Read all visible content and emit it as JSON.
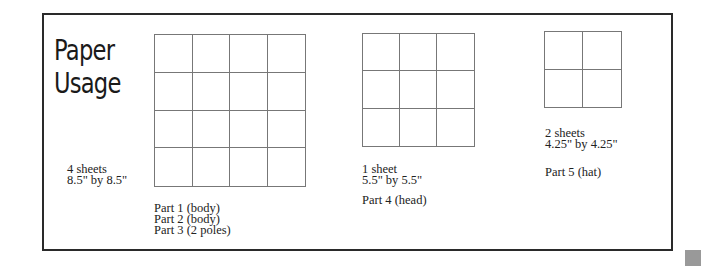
{
  "title": {
    "line1": "Paper",
    "line2": "Usage"
  },
  "sheets": [
    {
      "count": "4 sheets",
      "size": "8.5\" by 8.5\"",
      "grid": {
        "cols": 4,
        "rows": 4
      },
      "parts": [
        "Part 1 (body)",
        "Part 2 (body)",
        "Part 3 (2 poles)"
      ]
    },
    {
      "count": "1 sheet",
      "size": "5.5\" by 5.5\"",
      "grid": {
        "cols": 3,
        "rows": 3
      },
      "parts": [
        "Part 4 (head)"
      ]
    },
    {
      "count": "2 sheets",
      "size": "4.25\" by 4.25\"",
      "grid": {
        "cols": 2,
        "rows": 2
      },
      "parts": [
        "Part 5 (hat)"
      ]
    }
  ],
  "colors": {
    "border": "#2a2a2a",
    "grid_line": "#777777",
    "corner_block": "#999999"
  }
}
